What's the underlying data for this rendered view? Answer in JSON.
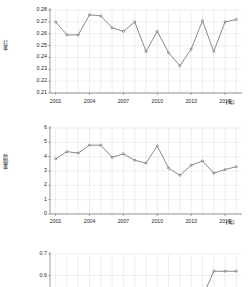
{
  "page": {
    "background": "#ffffff",
    "line_color": "#4a4a52",
    "grid_color": "#c9cfd6",
    "axis_color": "#55595e"
  },
  "chart_data": [
    {
      "id": "chart-1",
      "type": "line",
      "title": "",
      "ylabel": "打率",
      "xlabel": "",
      "xunit": "(年)",
      "ylim": [
        0.21,
        0.28
      ],
      "ytick_labels": [
        "0.28",
        "0.27",
        "0.26",
        "0.25",
        "0.24",
        "0.23",
        "0.22",
        "0.21"
      ],
      "ytick_values": [
        0.28,
        0.27,
        0.26,
        0.25,
        0.24,
        0.23,
        0.22,
        0.21
      ],
      "x": [
        2001,
        2002,
        2003,
        2004,
        2005,
        2006,
        2007,
        2008,
        2009,
        2010,
        2011,
        2012,
        2013,
        2014,
        2015,
        2016,
        2017
      ],
      "xtick_labels": [
        "2001",
        "2004",
        "2007",
        "2010",
        "2013",
        "2016"
      ],
      "xtick_values": [
        2001,
        2004,
        2007,
        2010,
        2013,
        2016
      ],
      "xlim": [
        2000.5,
        2017.5
      ],
      "values": [
        0.27,
        0.259,
        0.259,
        0.276,
        0.275,
        0.265,
        0.262,
        0.27,
        0.245,
        0.262,
        0.244,
        0.233,
        0.247,
        0.271,
        0.245,
        0.27,
        0.272
      ],
      "grid": true,
      "legend": "none"
    },
    {
      "id": "chart-2",
      "type": "line",
      "title": "",
      "ylabel": "防御率",
      "xlabel": "",
      "xunit": "(年)",
      "ylim": [
        0,
        6
      ],
      "ytick_labels": [
        "6",
        "5",
        "4",
        "3",
        "2",
        "1",
        "0"
      ],
      "ytick_values": [
        6,
        5,
        4,
        3,
        2,
        1,
        0
      ],
      "x": [
        2001,
        2002,
        2003,
        2004,
        2005,
        2006,
        2007,
        2008,
        2009,
        2010,
        2011,
        2012,
        2013,
        2014,
        2015,
        2016,
        2017
      ],
      "xtick_labels": [
        "2001",
        "2004",
        "2007",
        "2010",
        "2013",
        "2016"
      ],
      "xtick_values": [
        2001,
        2004,
        2007,
        2010,
        2013,
        2016
      ],
      "xlim": [
        2000.5,
        2017.5
      ],
      "values": [
        3.85,
        4.35,
        4.25,
        4.8,
        4.8,
        3.95,
        4.2,
        3.75,
        3.55,
        4.75,
        3.2,
        2.7,
        3.4,
        3.7,
        2.85,
        3.1,
        3.3
      ],
      "grid": true,
      "legend": "none"
    },
    {
      "id": "chart-3",
      "type": "line",
      "title": "",
      "ylabel": "",
      "xlabel": "",
      "xunit": "",
      "ylim": [
        0.44,
        0.7
      ],
      "ytick_labels": [
        "0.7",
        "0.6",
        "0.5"
      ],
      "ytick_values": [
        0.7,
        0.6,
        0.5
      ],
      "x": [
        2001,
        2002,
        2003,
        2004,
        2005,
        2006,
        2007,
        2008,
        2009,
        2010,
        2011,
        2012,
        2013,
        2014,
        2015,
        2016,
        2017
      ],
      "xtick_labels": [],
      "xtick_values": [],
      "xlim": [
        2000.5,
        2017.5
      ],
      "values": [
        0.51,
        0.48,
        0.5,
        0.455,
        0.45,
        0.44,
        0.5,
        0.47,
        0.45,
        0.445,
        0.48,
        0.49,
        0.515,
        0.5,
        0.62,
        0.62,
        0.62
      ],
      "grid": true,
      "legend": "none",
      "clipped_bottom": true
    }
  ]
}
